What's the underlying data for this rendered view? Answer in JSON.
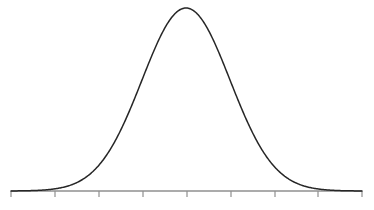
{
  "figure": {
    "title": "",
    "background_color": "#ffffff",
    "width": 374,
    "height": 210
  },
  "chart_data": {
    "type": "line",
    "title": "",
    "subtitle": "",
    "xlabel": "",
    "ylabel": "",
    "legend": [],
    "legend_position": "none",
    "grid": false,
    "annotations": [],
    "distribution": {
      "name": "normal",
      "mean_px": 186,
      "sigma_px": 44,
      "peak_px": {
        "x": 186,
        "y": 8
      },
      "baseline_y_px": 191,
      "curve_color": "#262626",
      "curve_width_px": 1.5
    },
    "axis": {
      "orientation": "horizontal",
      "y_px": 191,
      "x_start_px": 11,
      "x_end_px": 362,
      "color": "#8f8f8f",
      "tick_color": "#8f8f8f",
      "tick_length_px": 6,
      "tick_direction": "down",
      "tick_count": 9,
      "tick_positions_px": [
        11,
        55,
        99,
        143,
        187,
        231,
        275,
        318,
        362
      ],
      "tick_labels": [
        "",
        "",
        "",
        "",
        "",
        "",
        "",
        "",
        ""
      ],
      "sigma_units": [
        -4,
        -3,
        -2,
        -1,
        0,
        1,
        2,
        3,
        4
      ]
    },
    "x": [
      11,
      22,
      33,
      44,
      55,
      66,
      77,
      88,
      99,
      110,
      121,
      132,
      143,
      154,
      165,
      176,
      186,
      197,
      208,
      219,
      230,
      241,
      252,
      263,
      274,
      285,
      296,
      307,
      318,
      329,
      340,
      351,
      362
    ],
    "y": [
      0.0003,
      0.0012,
      0.0044,
      0.0139,
      0.038,
      0.0897,
      0.1827,
      0.3213,
      0.4868,
      0.6376,
      0.7753,
      0.8811,
      0.9463,
      0.9934,
      0.9998,
      0.9945,
      1.0,
      0.9935,
      0.9671,
      0.9002,
      0.808,
      0.6901,
      0.5556,
      0.4199,
      0.2899,
      0.1828,
      0.1052,
      0.0555,
      0.0267,
      0.0117,
      0.0047,
      0.0017,
      0.0006
    ],
    "ylim": [
      0,
      1.05
    ],
    "xlim": [
      11,
      362
    ]
  }
}
